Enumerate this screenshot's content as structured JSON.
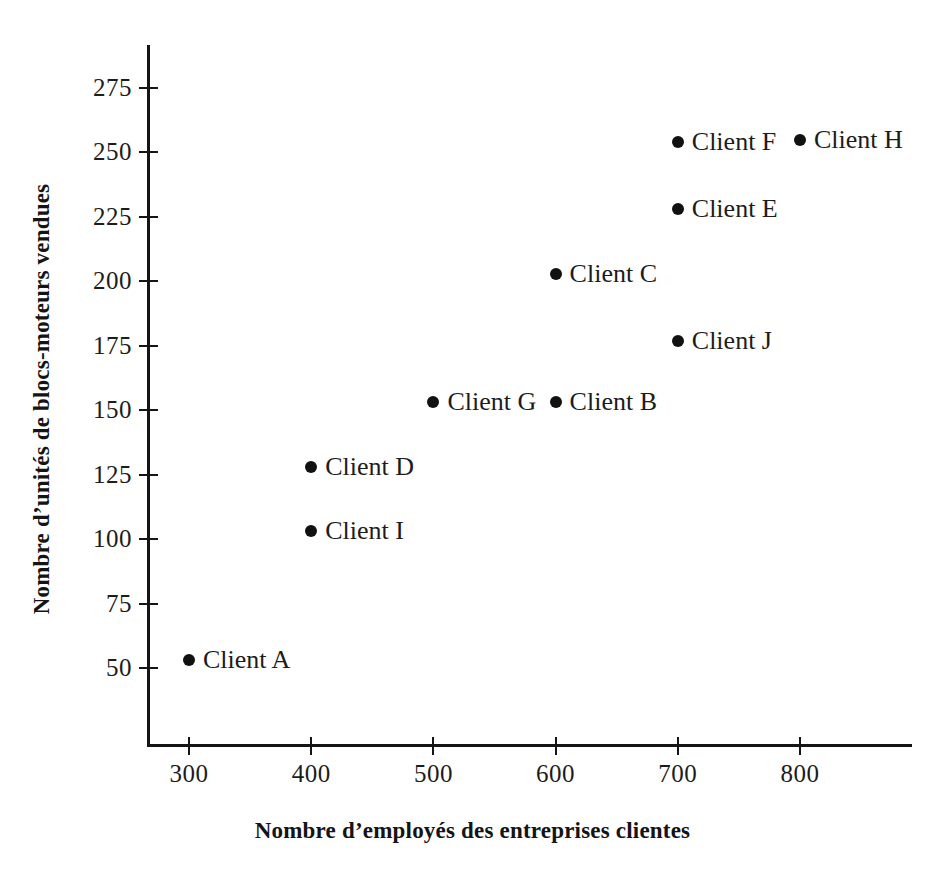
{
  "chart_data": {
    "type": "scatter",
    "title": "",
    "xlabel": "Nombre d’employés des entreprises clientes",
    "ylabel": "Nombre d’unités de blocs-moteurs vendues",
    "xlim": [
      250,
      880
    ],
    "ylim": [
      38,
      288
    ],
    "xticks": [
      300,
      400,
      500,
      600,
      700,
      800
    ],
    "xticklabels": [
      "300",
      "400",
      "500",
      "600",
      "700",
      "800"
    ],
    "yticks": [
      50,
      75,
      100,
      125,
      150,
      175,
      200,
      225,
      250,
      275
    ],
    "yticklabels": [
      "50",
      "75",
      "100",
      "125",
      "150",
      "175",
      "200",
      "225",
      "250",
      "275"
    ],
    "grid": false,
    "legend": "none",
    "marker_color": "#111111",
    "axis_color": "#151515",
    "background_color": "#ffffff",
    "points": [
      {
        "label": "Client A",
        "x": 300,
        "y": 53
      },
      {
        "label": "Client I",
        "x": 400,
        "y": 103
      },
      {
        "label": "Client D",
        "x": 400,
        "y": 128
      },
      {
        "label": "Client G",
        "x": 500,
        "y": 153
      },
      {
        "label": "Client B",
        "x": 600,
        "y": 153
      },
      {
        "label": "Client C",
        "x": 600,
        "y": 203
      },
      {
        "label": "Client J",
        "x": 700,
        "y": 177
      },
      {
        "label": "Client E",
        "x": 700,
        "y": 228
      },
      {
        "label": "Client F",
        "x": 700,
        "y": 254
      },
      {
        "label": "Client H",
        "x": 800,
        "y": 255
      }
    ]
  }
}
